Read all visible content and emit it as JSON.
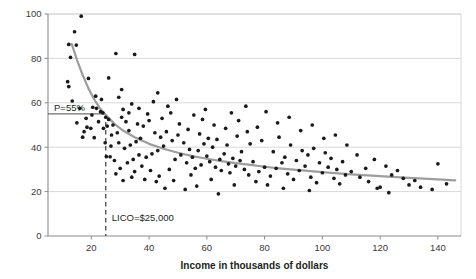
{
  "chart_data": {
    "type": "scatter",
    "title": "",
    "xlabel": "Income in thousands of dollars",
    "ylabel": "",
    "xlim": [
      5,
      148
    ],
    "ylim": [
      0,
      100
    ],
    "xticks": [
      20,
      40,
      60,
      80,
      100,
      120,
      140
    ],
    "yticks": [
      0,
      20,
      40,
      60,
      80,
      100
    ],
    "grid": "horizontal",
    "legend": "none",
    "annotations": [
      {
        "name": "p-threshold",
        "label": "P=55%",
        "y": 55,
        "type": "horizontal-reference"
      },
      {
        "name": "lico-threshold",
        "label": "LICO=$25,000",
        "x": 25,
        "type": "vertical-dashed-reference"
      }
    ],
    "trend_curve": {
      "name": "fitted-decay-curve",
      "color": "#9d9d9d",
      "points": [
        [
          13.2,
          86.5
        ],
        [
          15,
          79.5
        ],
        [
          17,
          72.5
        ],
        [
          19,
          66.5
        ],
        [
          21,
          61.5
        ],
        [
          23,
          57.5
        ],
        [
          25,
          54.5
        ],
        [
          28,
          50.5
        ],
        [
          31,
          47.5
        ],
        [
          35,
          44.5
        ],
        [
          40,
          41.5
        ],
        [
          45,
          39.3
        ],
        [
          50,
          37.5
        ],
        [
          55,
          36.0
        ],
        [
          60,
          34.8
        ],
        [
          65,
          33.7
        ],
        [
          70,
          32.8
        ],
        [
          75,
          32.0
        ],
        [
          80,
          31.2
        ],
        [
          85,
          30.5
        ],
        [
          90,
          29.9
        ],
        [
          95,
          29.3
        ],
        [
          100,
          28.8
        ],
        [
          110,
          27.8
        ],
        [
          120,
          27.0
        ],
        [
          130,
          26.2
        ],
        [
          140,
          25.5
        ],
        [
          146,
          25.1
        ]
      ]
    },
    "points": [
      [
        16.5,
        99.0
      ],
      [
        14.2,
        92.0
      ],
      [
        12.2,
        86.3
      ],
      [
        14.8,
        86.0
      ],
      [
        12.8,
        80.5
      ],
      [
        28.5,
        82.2
      ],
      [
        35.0,
        81.8
      ],
      [
        19.0,
        71.0
      ],
      [
        11.8,
        69.5
      ],
      [
        12.2,
        67.3
      ],
      [
        26.0,
        71.2
      ],
      [
        21.5,
        63.0
      ],
      [
        13.4,
        60.8
      ],
      [
        23.5,
        61.5
      ],
      [
        29.5,
        62.5
      ],
      [
        34.0,
        59.5
      ],
      [
        31.0,
        57.0
      ],
      [
        20.5,
        58.0
      ],
      [
        21.8,
        57.5
      ],
      [
        23.2,
        56.0
      ],
      [
        24.0,
        55.5
      ],
      [
        25.0,
        53.5
      ],
      [
        26.0,
        52.5
      ],
      [
        27.5,
        50.0
      ],
      [
        25.5,
        49.5
      ],
      [
        24.2,
        48.5
      ],
      [
        18.5,
        49.0
      ],
      [
        19.8,
        48.5
      ],
      [
        17.0,
        44.5
      ],
      [
        21.0,
        44.3
      ],
      [
        25.2,
        35.8
      ],
      [
        26.5,
        35.7
      ],
      [
        28.0,
        34.0
      ],
      [
        33.0,
        47.5
      ],
      [
        36.0,
        50.5
      ],
      [
        30.5,
        53.5
      ],
      [
        32.0,
        51.5
      ],
      [
        38.0,
        49.5
      ],
      [
        40.0,
        52.0
      ],
      [
        42.0,
        46.5
      ],
      [
        37.0,
        44.0
      ],
      [
        35.5,
        42.5
      ],
      [
        33.5,
        41.0
      ],
      [
        31.5,
        39.5
      ],
      [
        29.5,
        42.0
      ],
      [
        44.0,
        44.5
      ],
      [
        46.0,
        47.0
      ],
      [
        48.0,
        43.0
      ],
      [
        45.0,
        40.5
      ],
      [
        43.0,
        38.5
      ],
      [
        41.0,
        37.0
      ],
      [
        39.0,
        35.5
      ],
      [
        36.5,
        36.5
      ],
      [
        34.5,
        34.5
      ],
      [
        32.5,
        33.0
      ],
      [
        30.0,
        30.5
      ],
      [
        35.0,
        29.0
      ],
      [
        38.5,
        25.5
      ],
      [
        42.5,
        24.5
      ],
      [
        47.0,
        30.0
      ],
      [
        50.0,
        45.5
      ],
      [
        52.0,
        42.0
      ],
      [
        54.0,
        39.0
      ],
      [
        51.0,
        36.5
      ],
      [
        49.0,
        34.5
      ],
      [
        53.0,
        33.0
      ],
      [
        55.0,
        35.5
      ],
      [
        57.0,
        38.5
      ],
      [
        59.0,
        41.5
      ],
      [
        56.0,
        30.5
      ],
      [
        58.0,
        32.0
      ],
      [
        60.0,
        36.0
      ],
      [
        62.0,
        40.0
      ],
      [
        61.0,
        33.5
      ],
      [
        63.0,
        31.0
      ],
      [
        64.5,
        34.5
      ],
      [
        66.0,
        37.0
      ],
      [
        65.0,
        29.5
      ],
      [
        67.5,
        32.5
      ],
      [
        69.0,
        35.0
      ],
      [
        68.0,
        28.5
      ],
      [
        70.0,
        31.5
      ],
      [
        71.5,
        34.0
      ],
      [
        73.0,
        30.0
      ],
      [
        74.5,
        27.5
      ],
      [
        72.0,
        38.0
      ],
      [
        76.0,
        33.5
      ],
      [
        78.0,
        29.0
      ],
      [
        80.0,
        31.0
      ],
      [
        82.0,
        27.0
      ],
      [
        77.0,
        24.5
      ],
      [
        81.0,
        23.0
      ],
      [
        84.0,
        30.5
      ],
      [
        86.0,
        33.0
      ],
      [
        88.0,
        28.0
      ],
      [
        90.0,
        25.5
      ],
      [
        92.0,
        29.5
      ],
      [
        94.0,
        31.5
      ],
      [
        96.0,
        26.5
      ],
      [
        98.0,
        24.0
      ],
      [
        100.0,
        28.5
      ],
      [
        102.0,
        31.0
      ],
      [
        104.0,
        26.0
      ],
      [
        106.0,
        23.5
      ],
      [
        108.0,
        27.5
      ],
      [
        85.0,
        44.5
      ],
      [
        89.0,
        41.0
      ],
      [
        93.0,
        38.5
      ],
      [
        79.0,
        43.0
      ],
      [
        75.0,
        41.5
      ],
      [
        83.0,
        38.0
      ],
      [
        87.0,
        35.5
      ],
      [
        91.0,
        34.0
      ],
      [
        95.0,
        36.5
      ],
      [
        99.0,
        33.0
      ],
      [
        103.0,
        35.0
      ],
      [
        97.0,
        39.5
      ],
      [
        101.0,
        37.5
      ],
      [
        105.0,
        30.0
      ],
      [
        107.0,
        33.5
      ],
      [
        110.0,
        29.0
      ],
      [
        113.0,
        26.5
      ],
      [
        116.0,
        24.5
      ],
      [
        120.0,
        22.0
      ],
      [
        124.0,
        27.5
      ],
      [
        128.0,
        26.0
      ],
      [
        132.0,
        25.0
      ],
      [
        140.0,
        32.5
      ],
      [
        143.0,
        23.5
      ],
      [
        119.0,
        21.5
      ],
      [
        123.0,
        19.5
      ],
      [
        64.0,
        19.0
      ],
      [
        52.5,
        21.0
      ],
      [
        45.5,
        21.5
      ],
      [
        56.5,
        22.5
      ],
      [
        48.5,
        25.0
      ],
      [
        43.5,
        27.0
      ],
      [
        40.5,
        29.5
      ],
      [
        37.5,
        31.5
      ],
      [
        34.0,
        26.5
      ],
      [
        31.0,
        25.0
      ],
      [
        28.5,
        28.0
      ],
      [
        27.0,
        45.5
      ],
      [
        29.0,
        46.5
      ],
      [
        33.0,
        55.5
      ],
      [
        36.5,
        57.5
      ],
      [
        39.5,
        55.0
      ],
      [
        44.5,
        53.0
      ],
      [
        47.5,
        55.5
      ],
      [
        50.5,
        50.5
      ],
      [
        53.5,
        48.0
      ],
      [
        57.5,
        46.0
      ],
      [
        60.5,
        44.0
      ],
      [
        63.5,
        43.5
      ],
      [
        67.0,
        41.0
      ],
      [
        70.5,
        45.0
      ],
      [
        74.0,
        47.0
      ],
      [
        66.5,
        48.5
      ],
      [
        62.5,
        50.0
      ],
      [
        58.5,
        52.5
      ],
      [
        55.5,
        54.5
      ],
      [
        46.5,
        58.5
      ],
      [
        41.5,
        60.5
      ],
      [
        30.5,
        66.0
      ],
      [
        43.0,
        64.5
      ],
      [
        49.5,
        61.5
      ],
      [
        59.5,
        57.0
      ],
      [
        71.0,
        52.0
      ],
      [
        77.5,
        49.0
      ],
      [
        84.5,
        51.0
      ],
      [
        92.5,
        47.5
      ],
      [
        100.5,
        44.0
      ],
      [
        108.5,
        41.0
      ],
      [
        104.5,
        45.5
      ],
      [
        96.5,
        50.0
      ],
      [
        88.5,
        53.5
      ],
      [
        80.5,
        56.0
      ],
      [
        73.5,
        58.5
      ],
      [
        68.5,
        55.5
      ],
      [
        54.5,
        27.5
      ],
      [
        61.5,
        25.5
      ],
      [
        69.5,
        23.0
      ],
      [
        86.5,
        21.5
      ],
      [
        95.5,
        20.5
      ],
      [
        112.0,
        36.5
      ],
      [
        115.0,
        30.5
      ],
      [
        118.0,
        34.5
      ],
      [
        122.0,
        31.5
      ],
      [
        126.0,
        29.5
      ],
      [
        130.0,
        23.0
      ],
      [
        134.0,
        22.0
      ],
      [
        138.0,
        21.0
      ],
      [
        26.8,
        40.5
      ],
      [
        24.8,
        42.0
      ],
      [
        22.5,
        51.5
      ],
      [
        20.2,
        54.5
      ],
      [
        18.2,
        53.0
      ],
      [
        16.0,
        57.5
      ],
      [
        15.0,
        51.0
      ],
      [
        17.5,
        47.0
      ]
    ]
  },
  "axes": {
    "y_tick_labels": [
      "0",
      "20",
      "40",
      "60",
      "80",
      "100"
    ],
    "x_tick_labels": [
      "20",
      "40",
      "60",
      "80",
      "100",
      "120",
      "140"
    ],
    "x_axis_title": "Income in thousands of dollars"
  },
  "annotation_text": {
    "p_label": "P=55%",
    "lico_label": "LICO=$25,000"
  },
  "colors": {
    "point": "#1a1a1a",
    "curve": "#9d9d9d",
    "grid": "#d8d8d8",
    "axis": "#8c8c8c",
    "text": "#231f20"
  }
}
